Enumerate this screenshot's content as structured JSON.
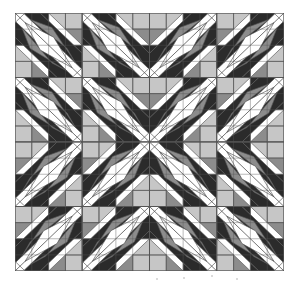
{
  "artwork": {
    "title": "Feathered Star Quilt Pattern",
    "palette": {
      "white": "#ffffff",
      "light": "#c6c6c6",
      "medium": "#8c8c8c",
      "dark": "#2b2b2b",
      "line": "#555555"
    },
    "quadrants": [
      {
        "name": "top-left",
        "orientation": "nw-se"
      },
      {
        "name": "top-right",
        "orientation": "ne-sw"
      },
      {
        "name": "bottom-left",
        "orientation": "ne-sw"
      },
      {
        "name": "bottom-right",
        "orientation": "nw-se"
      }
    ],
    "blocks_per_side": 4
  }
}
